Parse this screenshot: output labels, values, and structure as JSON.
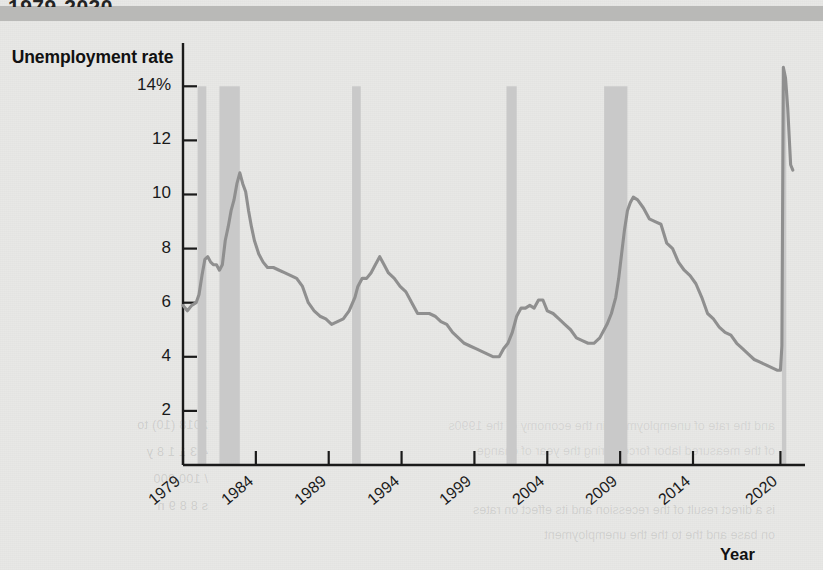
{
  "header": {
    "title": "1979-2020"
  },
  "chart_data": {
    "type": "line",
    "title": "1979-2020",
    "ylabel": "Unemployment rate",
    "xlabel": "Year",
    "ylim": [
      0,
      15.6
    ],
    "xlim": [
      1979,
      2021
    ],
    "grid": false,
    "legend": null,
    "y_ticks": [
      {
        "value": 14,
        "label": "14%"
      },
      {
        "value": 12,
        "label": "12"
      },
      {
        "value": 10,
        "label": "10"
      },
      {
        "value": 8,
        "label": "8"
      },
      {
        "value": 6,
        "label": "6"
      },
      {
        "value": 4,
        "label": "4"
      },
      {
        "value": 2,
        "label": "2"
      }
    ],
    "x_ticks": [
      {
        "value": 1979,
        "label": "1979"
      },
      {
        "value": 1984,
        "label": "1984"
      },
      {
        "value": 1989,
        "label": "1989"
      },
      {
        "value": 1994,
        "label": "1994"
      },
      {
        "value": 1999,
        "label": "1999"
      },
      {
        "value": 2004,
        "label": "2004"
      },
      {
        "value": 2009,
        "label": "2009"
      },
      {
        "value": 2014,
        "label": "2014"
      },
      {
        "value": 2020,
        "label": "2020"
      }
    ],
    "line_color": "#8f8f8f",
    "recession_color": "#c9c9c9",
    "recession_bands": [
      {
        "start": 1980.0,
        "end": 1980.6
      },
      {
        "start": 1981.5,
        "end": 1982.9
      },
      {
        "start": 1990.6,
        "end": 1991.2
      },
      {
        "start": 2001.2,
        "end": 2001.9
      },
      {
        "start": 2007.9,
        "end": 2009.5
      },
      {
        "start": 2020.1,
        "end": 2020.4
      }
    ],
    "series": [
      {
        "name": "Unemployment rate",
        "x": [
          1979.0,
          1979.3,
          1979.6,
          1979.9,
          1980.1,
          1980.3,
          1980.5,
          1980.7,
          1980.9,
          1981.1,
          1981.3,
          1981.5,
          1981.7,
          1981.9,
          1982.1,
          1982.3,
          1982.5,
          1982.7,
          1982.9,
          1983.1,
          1983.3,
          1983.5,
          1983.7,
          1983.9,
          1984.2,
          1984.5,
          1984.8,
          1985.2,
          1985.6,
          1986.0,
          1986.4,
          1986.8,
          1987.2,
          1987.6,
          1988.0,
          1988.4,
          1988.8,
          1989.2,
          1989.6,
          1990.0,
          1990.4,
          1990.8,
          1991.0,
          1991.3,
          1991.6,
          1991.9,
          1992.2,
          1992.5,
          1992.8,
          1993.1,
          1993.5,
          1993.9,
          1994.3,
          1994.7,
          1995.1,
          1995.5,
          1995.9,
          1996.3,
          1996.7,
          1997.1,
          1997.5,
          1997.9,
          1998.3,
          1998.7,
          1999.1,
          1999.5,
          1999.9,
          2000.3,
          2000.7,
          2001.0,
          2001.3,
          2001.6,
          2001.9,
          2002.2,
          2002.5,
          2002.8,
          2003.1,
          2003.4,
          2003.7,
          2004.0,
          2004.4,
          2004.8,
          2005.2,
          2005.6,
          2006.0,
          2006.4,
          2006.8,
          2007.2,
          2007.6,
          2007.9,
          2008.1,
          2008.4,
          2008.7,
          2008.9,
          2009.1,
          2009.3,
          2009.5,
          2009.7,
          2009.9,
          2010.2,
          2010.6,
          2011.0,
          2011.4,
          2011.8,
          2012.2,
          2012.6,
          2013.0,
          2013.4,
          2013.8,
          2014.2,
          2014.6,
          2015.0,
          2015.4,
          2015.8,
          2016.2,
          2016.6,
          2017.0,
          2017.4,
          2017.8,
          2018.2,
          2018.6,
          2019.0,
          2019.4,
          2019.8,
          2020.0,
          2020.1,
          2020.2,
          2020.35,
          2020.5,
          2020.7,
          2020.85
        ],
        "y": [
          5.9,
          5.7,
          5.9,
          6.0,
          6.3,
          7.0,
          7.6,
          7.7,
          7.5,
          7.4,
          7.4,
          7.2,
          7.4,
          8.3,
          8.8,
          9.4,
          9.8,
          10.4,
          10.8,
          10.4,
          10.1,
          9.4,
          8.8,
          8.3,
          7.8,
          7.5,
          7.3,
          7.3,
          7.2,
          7.1,
          7.0,
          6.9,
          6.6,
          6.0,
          5.7,
          5.5,
          5.4,
          5.2,
          5.3,
          5.4,
          5.7,
          6.2,
          6.6,
          6.9,
          6.9,
          7.1,
          7.4,
          7.7,
          7.4,
          7.1,
          6.9,
          6.6,
          6.4,
          6.0,
          5.6,
          5.6,
          5.6,
          5.5,
          5.3,
          5.2,
          4.9,
          4.7,
          4.5,
          4.4,
          4.3,
          4.2,
          4.1,
          4.0,
          4.0,
          4.3,
          4.5,
          4.9,
          5.5,
          5.8,
          5.8,
          5.9,
          5.8,
          6.1,
          6.1,
          5.7,
          5.6,
          5.4,
          5.2,
          5.0,
          4.7,
          4.6,
          4.5,
          4.5,
          4.7,
          5.0,
          5.2,
          5.6,
          6.2,
          6.9,
          7.8,
          8.7,
          9.4,
          9.7,
          9.9,
          9.8,
          9.5,
          9.1,
          9.0,
          8.9,
          8.2,
          8.0,
          7.5,
          7.2,
          7.0,
          6.7,
          6.2,
          5.6,
          5.4,
          5.1,
          4.9,
          4.8,
          4.5,
          4.3,
          4.1,
          3.9,
          3.8,
          3.7,
          3.6,
          3.5,
          3.5,
          4.4,
          14.7,
          14.3,
          13.2,
          11.1,
          10.9
        ]
      }
    ]
  }
}
